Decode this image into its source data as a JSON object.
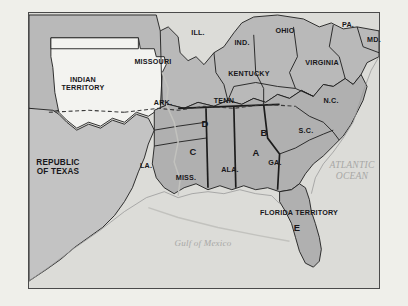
{
  "figure": {
    "frame_color": "#4a4a4a",
    "page_background": "#efefea"
  },
  "map": {
    "land_fill_north": "#b9b9b9",
    "land_fill_south": "#b0b0b0",
    "territory_fill": "#f3f3f0",
    "water_fill": "#dcdcd8",
    "border_color": "#1c1c1c"
  },
  "labels": {
    "states": [
      {
        "name": "illinois",
        "text": "ILL.",
        "x": 198,
        "y": 33,
        "size": "state"
      },
      {
        "name": "indiana",
        "text": "IND.",
        "x": 242,
        "y": 43,
        "size": "state"
      },
      {
        "name": "ohio",
        "text": "OHIO",
        "x": 285,
        "y": 31,
        "size": "state"
      },
      {
        "name": "pennsylvania",
        "text": "PA.",
        "x": 348,
        "y": 25,
        "size": "state"
      },
      {
        "name": "maryland",
        "text": "MD.",
        "x": 374,
        "y": 40,
        "size": "state"
      },
      {
        "name": "virginia",
        "text": "VIRGINIA",
        "x": 322,
        "y": 63,
        "size": "state"
      },
      {
        "name": "kentucky",
        "text": "KENTUCKY",
        "x": 249,
        "y": 74,
        "size": "state"
      },
      {
        "name": "missouri",
        "text": "MISSOURI",
        "x": 153,
        "y": 62,
        "size": "state"
      },
      {
        "name": "arkansas",
        "text": "ARK.",
        "x": 163,
        "y": 103,
        "size": "state"
      },
      {
        "name": "tennessee",
        "text": "TENN.",
        "x": 225,
        "y": 101,
        "size": "state"
      },
      {
        "name": "north-carolina",
        "text": "N.C.",
        "x": 331,
        "y": 101,
        "size": "state"
      },
      {
        "name": "south-carolina",
        "text": "S.C.",
        "x": 306,
        "y": 131,
        "size": "state"
      },
      {
        "name": "georgia",
        "text": "GA.",
        "x": 275,
        "y": 163,
        "size": "state"
      },
      {
        "name": "alabama",
        "text": "ALA.",
        "x": 230,
        "y": 170,
        "size": "state"
      },
      {
        "name": "mississippi",
        "text": "MISS.",
        "x": 186,
        "y": 178,
        "size": "state"
      },
      {
        "name": "louisiana",
        "text": "LA.",
        "x": 146,
        "y": 166,
        "size": "state"
      },
      {
        "name": "indian-territory",
        "text": "INDIAN\nTERRITORY",
        "x": 83,
        "y": 84,
        "size": "state"
      },
      {
        "name": "republic-of-texas",
        "text": "REPUBLIC\nOF TEXAS",
        "x": 58,
        "y": 167,
        "size": "big"
      },
      {
        "name": "florida-territory",
        "text": "FLORIDA TERRITORY",
        "x": 299,
        "y": 213,
        "size": "state"
      }
    ],
    "markers": [
      {
        "name": "marker-a",
        "text": "A",
        "x": 256,
        "y": 153
      },
      {
        "name": "marker-b",
        "text": "B",
        "x": 264,
        "y": 133
      },
      {
        "name": "marker-c",
        "text": "C",
        "x": 193,
        "y": 152
      },
      {
        "name": "marker-d",
        "text": "D",
        "x": 205,
        "y": 124
      },
      {
        "name": "marker-e",
        "text": "E",
        "x": 297,
        "y": 228
      }
    ],
    "water": [
      {
        "name": "atlantic-ocean",
        "text": "ATLANTIC\nOCEAN",
        "x": 352,
        "y": 171,
        "size": "ocean"
      },
      {
        "name": "gulf-of-mexico",
        "text": "Gulf of Mexico",
        "x": 203,
        "y": 243,
        "size": "gulf"
      }
    ]
  }
}
